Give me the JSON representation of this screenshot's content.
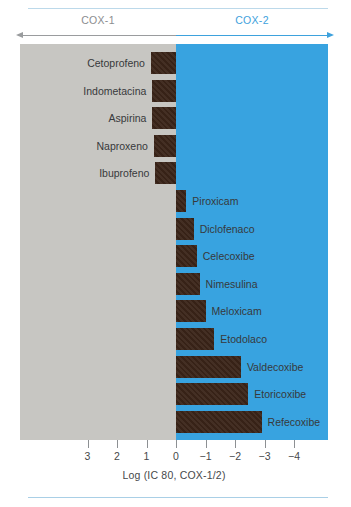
{
  "chart_data": {
    "type": "bar",
    "title": "",
    "orientation": "horizontal",
    "xlabel": "Log (IC 80, COX-1/2)",
    "ylabel": "",
    "xlim": [
      3.5,
      -4.5
    ],
    "xticks": [
      "3",
      "2",
      "1",
      "0",
      "−1",
      "−2",
      "−3",
      "−4"
    ],
    "xtick_values": [
      3,
      2,
      1,
      0,
      -1,
      -2,
      -3,
      -4
    ],
    "grid": false,
    "legend": false,
    "zero_reference": 0,
    "regions": [
      {
        "name": "COX-1",
        "label": "COX-1",
        "range": [
          3.5,
          0
        ],
        "color": "#c7c6c2",
        "label_color": "#8b8d8f"
      },
      {
        "name": "COX-2",
        "label": "COX-2",
        "range": [
          0,
          -4.5
        ],
        "color": "#38a3e0",
        "label_color": "#3ea2dd"
      }
    ],
    "bar_color": "#3a2418",
    "categories": [
      "Cetoprofeno",
      "Indometacina",
      "Aspirina",
      "Naproxeno",
      "Ibuprofeno",
      "Piroxicam",
      "Diclofenaco",
      "Celecoxibe",
      "Nimesulina",
      "Meloxicam",
      "Etodolaco",
      "Valdecoxibe",
      "Etoricoxibe",
      "Refecoxibe"
    ],
    "values": [
      0.85,
      0.8,
      0.8,
      0.75,
      0.7,
      -0.35,
      -0.6,
      -0.7,
      -0.8,
      -1.0,
      -1.3,
      -2.2,
      -2.45,
      -2.9
    ],
    "bars": [
      {
        "label": "Cetoprofeno",
        "value": 0.85,
        "selectivity": "COX-1",
        "label_side": "left"
      },
      {
        "label": "Indometacina",
        "value": 0.8,
        "selectivity": "COX-1",
        "label_side": "left"
      },
      {
        "label": "Aspirina",
        "value": 0.8,
        "selectivity": "COX-1",
        "label_side": "left"
      },
      {
        "label": "Naproxeno",
        "value": 0.75,
        "selectivity": "COX-1",
        "label_side": "left"
      },
      {
        "label": "Ibuprofeno",
        "value": 0.7,
        "selectivity": "COX-1",
        "label_side": "left"
      },
      {
        "label": "Piroxicam",
        "value": -0.35,
        "selectivity": "COX-2",
        "label_side": "right"
      },
      {
        "label": "Diclofenaco",
        "value": -0.6,
        "selectivity": "COX-2",
        "label_side": "right"
      },
      {
        "label": "Celecoxibe",
        "value": -0.7,
        "selectivity": "COX-2",
        "label_side": "right"
      },
      {
        "label": "Nimesulina",
        "value": -0.8,
        "selectivity": "COX-2",
        "label_side": "right"
      },
      {
        "label": "Meloxicam",
        "value": -1.0,
        "selectivity": "COX-2",
        "label_side": "right"
      },
      {
        "label": "Etodolaco",
        "value": -1.3,
        "selectivity": "COX-2",
        "label_side": "right"
      },
      {
        "label": "Valdecoxibe",
        "value": -2.2,
        "selectivity": "COX-2",
        "label_side": "right"
      },
      {
        "label": "Etoricoxibe",
        "value": -2.45,
        "selectivity": "COX-2",
        "label_side": "right"
      },
      {
        "label": "Refecoxibe",
        "value": -2.9,
        "selectivity": "COX-2",
        "label_side": "right"
      }
    ]
  },
  "header": {
    "cox1_label": "COX-1",
    "cox2_label": "COX-2"
  },
  "axis": {
    "title": "Log (IC 80, COX-1/2)",
    "ticks": [
      "3",
      "2",
      "1",
      "0",
      "−1",
      "−2",
      "−3",
      "−4"
    ]
  },
  "colors": {
    "cox1_region": "#c7c6c2",
    "cox2_region": "#38a3e0",
    "bar": "#3a2418",
    "cox1_text": "#8b8d8f",
    "cox2_text": "#3ea2dd",
    "rule": "#bcd9ea"
  }
}
